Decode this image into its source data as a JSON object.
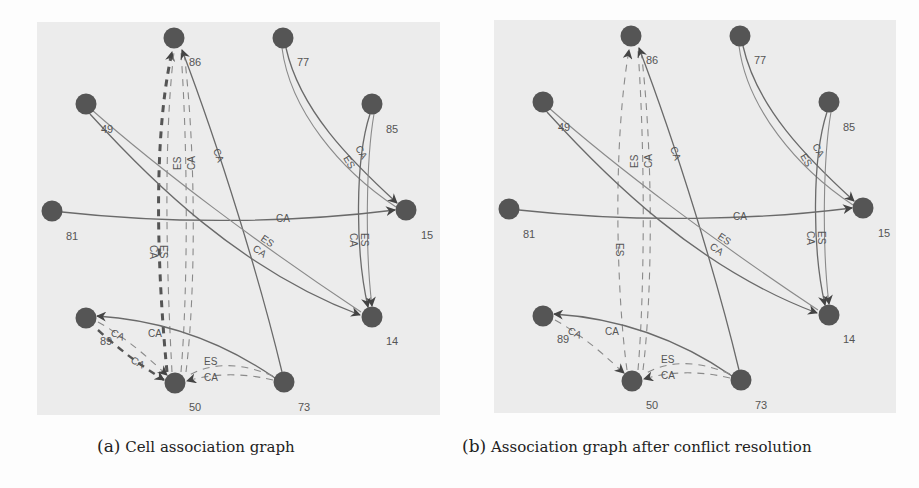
{
  "figure": {
    "panels": [
      {
        "id": "a",
        "caption_tag": "(a)",
        "caption_text": "Cell association graph",
        "nodes": [
          {
            "id": "86",
            "label": "86"
          },
          {
            "id": "77",
            "label": "77"
          },
          {
            "id": "49",
            "label": "49"
          },
          {
            "id": "85",
            "label": "85"
          },
          {
            "id": "81",
            "label": "81"
          },
          {
            "id": "15",
            "label": "15"
          },
          {
            "id": "89",
            "label": "89"
          },
          {
            "id": "14",
            "label": "14"
          },
          {
            "id": "50",
            "label": "50"
          },
          {
            "id": "73",
            "label": "73"
          }
        ],
        "edges": [
          {
            "from": "50",
            "to": "86",
            "label": "CA",
            "style": "dashed-bold"
          },
          {
            "from": "86",
            "to": "50",
            "label": "ES",
            "style": "dashed"
          },
          {
            "from": "50",
            "to": "86",
            "label": "ES",
            "style": "dashed"
          },
          {
            "from": "50",
            "to": "86",
            "label": "CA",
            "style": "dashed"
          },
          {
            "from": "73",
            "to": "86",
            "label": "CA",
            "style": "solid"
          },
          {
            "from": "77",
            "to": "15",
            "label": "CA",
            "style": "solid"
          },
          {
            "from": "77",
            "to": "15",
            "label": "ES",
            "style": "solid"
          },
          {
            "from": "85",
            "to": "14",
            "label": "CA",
            "style": "solid"
          },
          {
            "from": "85",
            "to": "14",
            "label": "ES",
            "style": "solid"
          },
          {
            "from": "81",
            "to": "15",
            "label": "CA",
            "style": "solid"
          },
          {
            "from": "49",
            "to": "14",
            "label": "ES",
            "style": "solid"
          },
          {
            "from": "49",
            "to": "14",
            "label": "CA",
            "style": "solid"
          },
          {
            "from": "73",
            "to": "89",
            "label": "CA",
            "style": "solid"
          },
          {
            "from": "89",
            "to": "50",
            "label": "CA",
            "style": "dashed"
          },
          {
            "from": "50",
            "to": "89",
            "label": "CA",
            "style": "dashed-bold"
          },
          {
            "from": "73",
            "to": "50",
            "label": "ES",
            "style": "dashed"
          },
          {
            "from": "73",
            "to": "50",
            "label": "CA",
            "style": "dashed"
          }
        ]
      },
      {
        "id": "b",
        "caption_tag": "(b)",
        "caption_text": "Association graph after conflict resolution",
        "nodes": [
          {
            "id": "86",
            "label": "86"
          },
          {
            "id": "77",
            "label": "77"
          },
          {
            "id": "49",
            "label": "49"
          },
          {
            "id": "85",
            "label": "85"
          },
          {
            "id": "81",
            "label": "81"
          },
          {
            "id": "15",
            "label": "15"
          },
          {
            "id": "89",
            "label": "89"
          },
          {
            "id": "14",
            "label": "14"
          },
          {
            "id": "50",
            "label": "50"
          },
          {
            "id": "73",
            "label": "73"
          }
        ],
        "edges": [
          {
            "from": "86",
            "to": "50",
            "label": "ES",
            "style": "dashed"
          },
          {
            "from": "50",
            "to": "86",
            "label": "ES",
            "style": "dashed"
          },
          {
            "from": "50",
            "to": "86",
            "label": "CA",
            "style": "dashed"
          },
          {
            "from": "73",
            "to": "86",
            "label": "CA",
            "style": "solid"
          },
          {
            "from": "77",
            "to": "15",
            "label": "CA",
            "style": "solid"
          },
          {
            "from": "77",
            "to": "15",
            "label": "ES",
            "style": "solid"
          },
          {
            "from": "85",
            "to": "14",
            "label": "CA",
            "style": "solid"
          },
          {
            "from": "85",
            "to": "14",
            "label": "ES",
            "style": "solid"
          },
          {
            "from": "81",
            "to": "15",
            "label": "CA",
            "style": "solid"
          },
          {
            "from": "49",
            "to": "14",
            "label": "ES",
            "style": "solid"
          },
          {
            "from": "49",
            "to": "14",
            "label": "CA",
            "style": "solid"
          },
          {
            "from": "73",
            "to": "89",
            "label": "CA",
            "style": "solid"
          },
          {
            "from": "89",
            "to": "50",
            "label": "CA",
            "style": "dashed"
          },
          {
            "from": "73",
            "to": "50",
            "label": "ES",
            "style": "dashed"
          },
          {
            "from": "73",
            "to": "50",
            "label": "CA",
            "style": "dashed"
          }
        ]
      }
    ],
    "edge_label_types": [
      "CA",
      "ES"
    ],
    "colors": {
      "panel_background": "#ececec",
      "node_fill": "#555555",
      "edge_stroke": "#6a6a6a",
      "page_background": "#fdfdfd"
    }
  }
}
